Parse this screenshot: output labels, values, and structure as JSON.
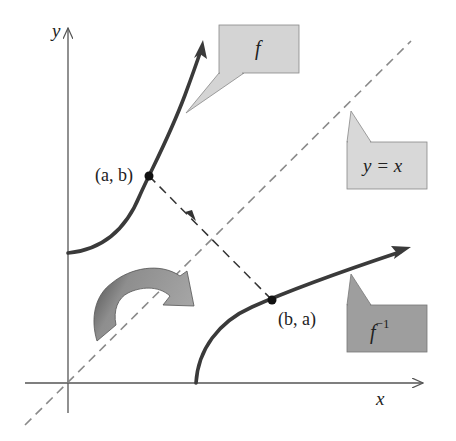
{
  "diagram": {
    "axes": {
      "x_label": "x",
      "y_label": "y"
    },
    "curves": {
      "f": {
        "label": "f"
      },
      "f_inverse": {
        "label_base": "f",
        "label_sup": "−1"
      }
    },
    "line": {
      "label": "y = x"
    },
    "points": {
      "p1": {
        "label": "(a, b)"
      },
      "p2": {
        "label": "(b, a)"
      }
    },
    "colors": {
      "axis": "#555555",
      "curve": "#3a3a3a",
      "dash": "#888888",
      "callout_light": "#d4d4d4",
      "callout_dark": "#9a9a9a",
      "arrow_light": "#9c9c9c",
      "arrow_dark": "#4a4a4a"
    }
  }
}
